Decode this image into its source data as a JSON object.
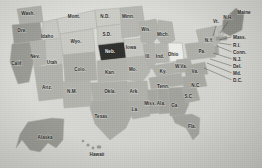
{
  "map": {
    "title": "United States map with state abbreviations",
    "background_color": "#d8d8d4",
    "default_state_color": "#bdbdb8",
    "alt_state_color": "#a8a8a3",
    "highlight_dark_color": "#2f2f2d",
    "highlight_light_color": "#eeeeea",
    "border_color": "#b0b0ab",
    "label_color": "#2a2a28",
    "highlighted_state": "Neb.",
    "highlight_style": "dark-fill",
    "secondary_highlight_state": "Ohio",
    "secondary_highlight_style": "light-fill"
  },
  "states": [
    {
      "id": "wash",
      "label": "Wash.",
      "x": 28,
      "y": 14,
      "shade": "mid"
    },
    {
      "id": "ore",
      "label": "Ore.",
      "x": 22,
      "y": 31,
      "shade": "dark"
    },
    {
      "id": "calif",
      "label": "Calif.",
      "x": 17,
      "y": 64,
      "shade": "dark"
    },
    {
      "id": "idaho",
      "label": "Idaho",
      "x": 47,
      "y": 37,
      "shade": "light"
    },
    {
      "id": "nev",
      "label": "Nev.",
      "x": 35,
      "y": 57,
      "shade": "mid"
    },
    {
      "id": "utah",
      "label": "Utah",
      "x": 52,
      "y": 63,
      "shade": "light"
    },
    {
      "id": "ariz",
      "label": "Ariz.",
      "x": 47,
      "y": 88,
      "shade": "mid"
    },
    {
      "id": "mont",
      "label": "Mont.",
      "x": 74,
      "y": 17,
      "shade": "light"
    },
    {
      "id": "wyo",
      "label": "Wyo.",
      "x": 76,
      "y": 42,
      "shade": "light"
    },
    {
      "id": "colo",
      "label": "Colo.",
      "x": 80,
      "y": 70,
      "shade": "mid"
    },
    {
      "id": "nmex",
      "label": "N.M.",
      "x": 72,
      "y": 92,
      "shade": "mid"
    },
    {
      "id": "ndak",
      "label": "N.D.",
      "x": 105,
      "y": 17,
      "shade": "light"
    },
    {
      "id": "sdak",
      "label": "S.D.",
      "x": 107,
      "y": 35,
      "shade": "light"
    },
    {
      "id": "neb",
      "label": "Neb.",
      "x": 110,
      "y": 52,
      "shade": "highlight-dark"
    },
    {
      "id": "kan",
      "label": "Kan.",
      "x": 110,
      "y": 73,
      "shade": "mid"
    },
    {
      "id": "okla",
      "label": "Okla.",
      "x": 110,
      "y": 92,
      "shade": "mid"
    },
    {
      "id": "texas",
      "label": "Texas",
      "x": 101,
      "y": 117,
      "shade": "mid"
    },
    {
      "id": "minn",
      "label": "Minn.",
      "x": 128,
      "y": 17,
      "shade": "mid"
    },
    {
      "id": "iowa",
      "label": "Iowa",
      "x": 131,
      "y": 48,
      "shade": "light"
    },
    {
      "id": "mo",
      "label": "Mo.",
      "x": 133,
      "y": 70,
      "shade": "mid"
    },
    {
      "id": "ark",
      "label": "Ark.",
      "x": 134,
      "y": 92,
      "shade": "mid"
    },
    {
      "id": "la",
      "label": "La.",
      "x": 135,
      "y": 110,
      "shade": "mid"
    },
    {
      "id": "wis",
      "label": "Wis.",
      "x": 146,
      "y": 30,
      "shade": "mid"
    },
    {
      "id": "ill",
      "label": "Ill.",
      "x": 148,
      "y": 57,
      "shade": "mid"
    },
    {
      "id": "mich",
      "label": "Mich.",
      "x": 163,
      "y": 35,
      "shade": "mid"
    },
    {
      "id": "ind",
      "label": "Ind.",
      "x": 160,
      "y": 57,
      "shade": "mid"
    },
    {
      "id": "ohio",
      "label": "Ohio",
      "x": 173,
      "y": 55,
      "shade": "highlight-light"
    },
    {
      "id": "ky",
      "label": "Ky.",
      "x": 163,
      "y": 72,
      "shade": "mid"
    },
    {
      "id": "tenn",
      "label": "Tenn.",
      "x": 163,
      "y": 87,
      "shade": "mid"
    },
    {
      "id": "miss",
      "label": "Miss.",
      "x": 150,
      "y": 104,
      "shade": "mid"
    },
    {
      "id": "ala",
      "label": "Ala.",
      "x": 161,
      "y": 104,
      "shade": "mid"
    },
    {
      "id": "ga",
      "label": "Ga.",
      "x": 175,
      "y": 106,
      "shade": "mid"
    },
    {
      "id": "fla",
      "label": "Fla.",
      "x": 192,
      "y": 127,
      "shade": "mid"
    },
    {
      "id": "scar",
      "label": "S.C.",
      "x": 189,
      "y": 97,
      "shade": "mid"
    },
    {
      "id": "ncar",
      "label": "N.C.",
      "x": 196,
      "y": 86,
      "shade": "mid"
    },
    {
      "id": "wva",
      "label": "W.Va.",
      "x": 181,
      "y": 67,
      "shade": "mid"
    },
    {
      "id": "va",
      "label": "Va.",
      "x": 195,
      "y": 72,
      "shade": "mid"
    },
    {
      "id": "pa",
      "label": "Pa.",
      "x": 202,
      "y": 52,
      "shade": "mid"
    },
    {
      "id": "ny",
      "label": "N.Y.",
      "x": 209,
      "y": 41,
      "shade": "mid"
    },
    {
      "id": "vt",
      "label": "Vt.",
      "x": 216,
      "y": 22,
      "shade": "callout"
    },
    {
      "id": "nh",
      "label": "N.H.",
      "x": 228,
      "y": 18,
      "shade": "callout"
    },
    {
      "id": "maine",
      "label": "Maine",
      "x": 244,
      "y": 13,
      "shade": "mid"
    },
    {
      "id": "alaska",
      "label": "Alaska",
      "x": 45,
      "y": 138,
      "shade": "dark"
    },
    {
      "id": "hawaii",
      "label": "Hawaii",
      "x": 97,
      "y": 155,
      "shade": "mid"
    }
  ],
  "callouts": [
    {
      "id": "mass",
      "label": "Mass.",
      "lx": 233,
      "ly": 38,
      "px": 219,
      "py": 40
    },
    {
      "id": "ri",
      "label": "R.I.",
      "lx": 233,
      "ly": 46,
      "px": 219,
      "py": 43
    },
    {
      "id": "conn",
      "label": "Conn.",
      "lx": 233,
      "ly": 53,
      "px": 217,
      "py": 46
    },
    {
      "id": "nj",
      "label": "N.J.",
      "lx": 233,
      "ly": 60,
      "px": 213,
      "py": 53
    },
    {
      "id": "del",
      "label": "Del.",
      "lx": 233,
      "ly": 67,
      "px": 210,
      "py": 59
    },
    {
      "id": "md",
      "label": "Md.",
      "lx": 233,
      "ly": 74,
      "px": 207,
      "py": 63
    },
    {
      "id": "dc",
      "label": "D.C.",
      "lx": 233,
      "ly": 81,
      "px": 204,
      "py": 68
    }
  ],
  "callout_short": [
    {
      "id": "vt-line",
      "x1": 216,
      "y1": 26,
      "x2": 213,
      "y2": 36
    },
    {
      "id": "nh-line",
      "x1": 228,
      "y1": 22,
      "x2": 220,
      "y2": 33
    }
  ]
}
